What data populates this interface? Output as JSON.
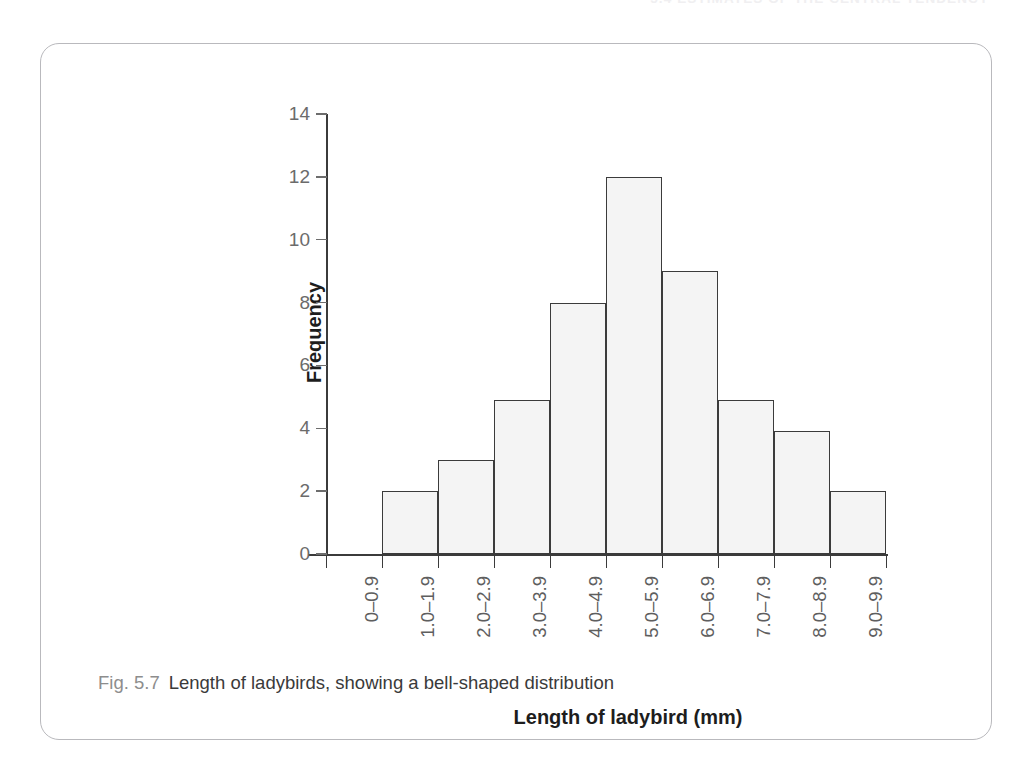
{
  "page": {
    "running_header": "5.4 ESTIMATES OF THE CENTRAL TENDENCY"
  },
  "figure": {
    "caption_number": "Fig. 5.7",
    "caption_text": "Length of ladybirds, showing a bell-shaped distribution"
  },
  "chart_data": {
    "type": "bar",
    "title": "",
    "xlabel": "Length of ladybird (mm)",
    "ylabel": "Frequency",
    "categories": [
      "0–0.9",
      "1.0–1.9",
      "2.0–2.9",
      "3.0–3.9",
      "4.0–4.9",
      "5.0–5.9",
      "6.0–6.9",
      "7.0–7.9",
      "8.0–8.9",
      "9.0–9.9"
    ],
    "values": [
      0,
      2,
      3,
      4.9,
      8,
      12,
      9,
      4.9,
      3.9,
      2
    ],
    "ylim": [
      0,
      14
    ],
    "ytick_labels": [
      "0",
      "2",
      "4",
      "6",
      "8",
      "10",
      "12",
      "14"
    ],
    "ytick_values": [
      0,
      2,
      4,
      6,
      8,
      10,
      12,
      14
    ],
    "grid": false,
    "legend": false,
    "bar_fill": "#f4f4f4",
    "bar_stroke": "#3b3b3b",
    "axis_color": "#3b3b3b",
    "tick_label_color": "#6b6b6b"
  }
}
